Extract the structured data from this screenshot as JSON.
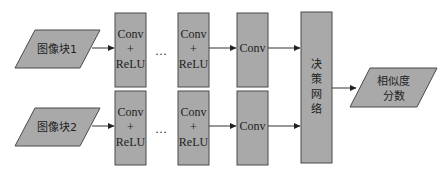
{
  "diagram": {
    "inputs": [
      {
        "label": "图像块1"
      },
      {
        "label": "图像块2"
      }
    ],
    "conv_relu": {
      "line1": "Conv",
      "line2": "+",
      "line3": "ReLU"
    },
    "ellipsis": "…",
    "conv": "Conv",
    "decision": {
      "chars": [
        "决",
        "策",
        "网",
        "络"
      ]
    },
    "output": {
      "line1": "相似度",
      "line2": "分数"
    },
    "colors": {
      "fill": "#a9a9a9",
      "stroke": "#4a4a4a"
    }
  }
}
